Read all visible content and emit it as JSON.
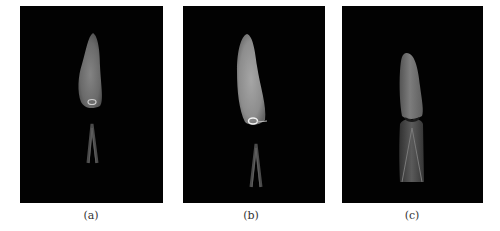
{
  "figure": {
    "panels": [
      {
        "id": "a",
        "label": "(a)",
        "subject": "flame-with-detached-inner-cone",
        "background": "#020202"
      },
      {
        "id": "b",
        "label": "(b)",
        "subject": "brighter-flame-with-detached-inner-cone",
        "background": "#020202"
      },
      {
        "id": "c",
        "label": "(c)",
        "subject": "flame-attached-to-inner-cone",
        "background": "#020202"
      }
    ]
  }
}
